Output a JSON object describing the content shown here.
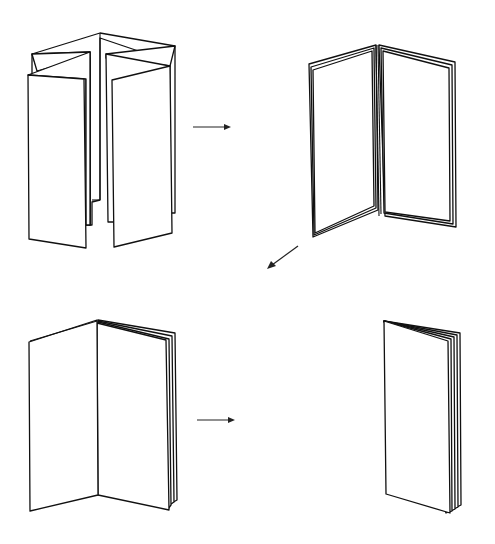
{
  "diagram": {
    "title": "",
    "steps": [
      {
        "id": "step-1",
        "label": "",
        "depicts": "four folded signatures standing apart around a shared spine"
      },
      {
        "id": "step-2",
        "label": "",
        "depicts": "signatures nested together into an open booklet"
      },
      {
        "id": "step-3",
        "label": "",
        "depicts": "booklet viewed opened with stacked pages on the right"
      },
      {
        "id": "step-4",
        "label": "",
        "depicts": "booklet closed, pages stacked"
      }
    ],
    "arrows": [
      {
        "from": "step-1",
        "to": "step-2",
        "direction": "right"
      },
      {
        "from": "step-2",
        "to": "step-3",
        "direction": "down-left"
      },
      {
        "from": "step-3",
        "to": "step-4",
        "direction": "right"
      }
    ],
    "colors": {
      "line": "#111111",
      "background": "#ffffff"
    }
  }
}
